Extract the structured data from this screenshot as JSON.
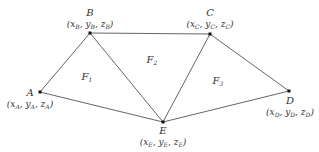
{
  "diagram": {
    "type": "triangulated-surface",
    "colors": {
      "edge": "#555555",
      "vertex": "#111111",
      "text": "#333333",
      "background": "#ffffff"
    },
    "points": {
      "A": {
        "name": "A",
        "coord_prefix": "(x",
        "x_sub": "A",
        "mid_y": ", y",
        "y_sub": "A",
        "mid_z": ", z",
        "z_sub": "A",
        "coord_suffix": ")"
      },
      "B": {
        "name": "B",
        "coord_prefix": "(x",
        "x_sub": "B",
        "mid_y": ", y",
        "y_sub": "B",
        "mid_z": ", z",
        "z_sub": "B",
        "coord_suffix": ")"
      },
      "C": {
        "name": "C",
        "coord_prefix": "(x",
        "x_sub": "C",
        "mid_y": ", y",
        "y_sub": "C",
        "mid_z": ", z",
        "z_sub": "C",
        "coord_suffix": ")"
      },
      "D": {
        "name": "D",
        "coord_prefix": "(x",
        "x_sub": "D",
        "mid_y": ", y",
        "y_sub": "D",
        "mid_z": ", z",
        "z_sub": "D",
        "coord_suffix": ")"
      },
      "E": {
        "name": "E",
        "coord_prefix": "(x",
        "x_sub": "E",
        "mid_y": ", y",
        "y_sub": "E",
        "mid_z": ", z",
        "z_sub": "E",
        "coord_suffix": ")"
      }
    },
    "faces": [
      {
        "main": "F",
        "sub": "1"
      },
      {
        "main": "F",
        "sub": "2"
      },
      {
        "main": "F",
        "sub": "3"
      }
    ],
    "edges": [
      "A-B",
      "B-E",
      "B-C",
      "C-E",
      "C-D",
      "A-E",
      "E-D"
    ]
  }
}
